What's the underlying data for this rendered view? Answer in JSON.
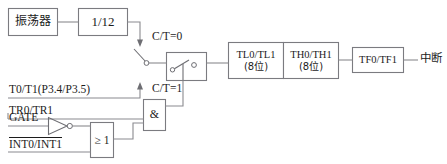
{
  "diagram": {
    "blocks": {
      "oscillator": {
        "label": "振荡器"
      },
      "divider": {
        "label": "1/12"
      },
      "timer_low": {
        "label_line1": "TL0/TL1",
        "label_line2": "(8位)"
      },
      "timer_high": {
        "label_line1": "TH0/TH1",
        "label_line2": "(8位)"
      },
      "flag": {
        "label": "TF0/TF1"
      },
      "and_gate": {
        "label": "&"
      },
      "or_gate": {
        "label": "≥ 1"
      },
      "selector_switch": {
        "label": ""
      }
    },
    "signals": {
      "ct_zero": "C/T=0",
      "ct_one": "C/T=1",
      "t0_t1": "T0/T1(P3.4/P3.5)",
      "tr0_tr1": "TR0/TR1",
      "gate": "GATE",
      "int0_int1": "INT0/INT1",
      "interrupt": "中断"
    },
    "icons": {
      "knife_switch": "knife-switch-icon",
      "inverter": "inverter-triangle-icon",
      "inverter_bubble": "inverter-bubble-icon",
      "switch_contact": "switch-contact-icon",
      "arrow_up": "arrow-up-icon",
      "arrow_down": "arrow-down-icon"
    },
    "colors": {
      "stroke": "#7b7b80",
      "wire": "#8a8a8f",
      "text": "#1c1c1c",
      "background": "#ffffff"
    }
  }
}
